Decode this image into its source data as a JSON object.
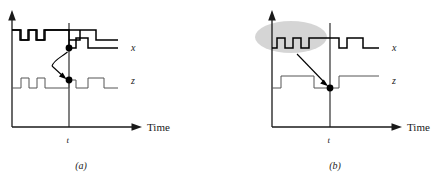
{
  "figure": {
    "background": "#ffffff",
    "width": 438,
    "height": 181
  },
  "colors": {
    "axis": "#1a1a1a",
    "wave_x": "#000000",
    "wave_z": "#555555",
    "dot": "#000000",
    "highlight_blob": "#c9c9c9",
    "arrow": "#000000"
  },
  "panels": [
    {
      "id": "a",
      "caption": "(a)",
      "axis": {
        "time_label": "Time",
        "tick_label": "t",
        "vertical_arrow": "up-arrow-icon",
        "horizontal_arrow": "right-arrow-icon"
      },
      "signals": [
        {
          "name": "x",
          "label": "x",
          "kind": "digital-waveform",
          "level_at_t": "low",
          "transitions_note": "starts high, two narrow low-going notches, returns high, one pulse after t"
        },
        {
          "name": "z",
          "label": "z",
          "kind": "digital-waveform",
          "level_at_t": "low",
          "transitions_note": "starts low, two narrow high pulses, high across t region, pulse after t"
        }
      ],
      "annotation": {
        "type": "curved-arrow",
        "from_signal": "x",
        "to_signal": "z",
        "dots": 2,
        "note": "sample point on x maps to sample point on z at time t"
      }
    },
    {
      "id": "b",
      "caption": "(b)",
      "axis": {
        "time_label": "Time",
        "tick_label": "t",
        "vertical_arrow": "up-arrow-icon",
        "horizontal_arrow": "right-arrow-icon"
      },
      "signals": [
        {
          "name": "x",
          "label": "x",
          "kind": "digital-waveform",
          "level_at_t": "high",
          "transitions_note": "three narrow high pulses inside highlighted region, then a wider pulse after t"
        },
        {
          "name": "z",
          "label": "z",
          "kind": "digital-waveform",
          "level_at_t": "low",
          "transitions_note": "starts low, one wide high pulse, low across t, then high"
        }
      ],
      "annotation": {
        "type": "straight-arrow",
        "from_signal": "x",
        "to_signal": "z",
        "dots": 1,
        "highlight": {
          "shape": "ellipse",
          "color": "#c9c9c9",
          "covers": "early pulse burst on x"
        },
        "note": "highlighted burst on x collapses to single sample on z at time t"
      }
    }
  ]
}
